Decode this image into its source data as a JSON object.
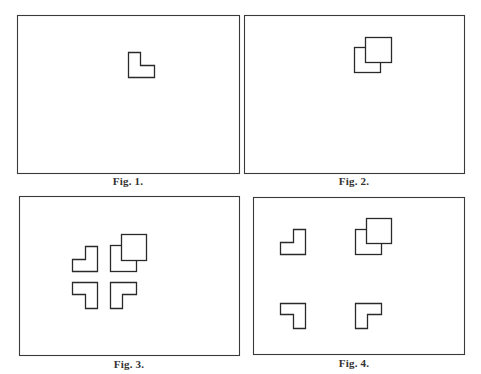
{
  "figures": [
    {
      "id": "fig1",
      "caption": "Fig. 1.",
      "shapes": [
        {
          "kind": "l-shape",
          "orientation": "L"
        }
      ]
    },
    {
      "id": "fig2",
      "caption": "Fig. 2.",
      "shapes": [
        {
          "kind": "l-shape-with-square",
          "orientation": "L",
          "overlay": "square"
        }
      ]
    },
    {
      "id": "fig3",
      "caption": "Fig. 3.",
      "shapes": [
        {
          "kind": "l-shape",
          "orientation": "mirrored-L",
          "position": "top-left"
        },
        {
          "kind": "l-shape-with-square",
          "orientation": "L",
          "overlay": "square",
          "position": "top-right"
        },
        {
          "kind": "l-shape",
          "orientation": "rotated-180",
          "position": "bottom-left"
        },
        {
          "kind": "l-shape",
          "orientation": "gamma",
          "position": "bottom-right"
        }
      ],
      "arrangement": "clustered"
    },
    {
      "id": "fig4",
      "caption": "Fig. 4.",
      "shapes": [
        {
          "kind": "l-shape",
          "orientation": "mirrored-L",
          "position": "top-left"
        },
        {
          "kind": "l-shape-with-square",
          "orientation": "L",
          "overlay": "square",
          "position": "top-right"
        },
        {
          "kind": "l-shape",
          "orientation": "rotated-180",
          "position": "bottom-left"
        },
        {
          "kind": "l-shape",
          "orientation": "gamma",
          "position": "bottom-right"
        }
      ],
      "arrangement": "spread"
    }
  ],
  "colors": {
    "ink": "#2a2a2a",
    "paper": "#ffffff"
  }
}
